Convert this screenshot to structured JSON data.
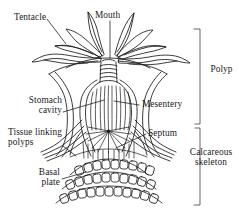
{
  "figure": {
    "type": "biological-line-diagram",
    "ink_color": "#1a1a1a",
    "background_color": "#ffffff"
  },
  "labels": {
    "tentacle": "Tentacle",
    "mouth": "Mouth",
    "stomach_cavity_line1": "Stomach",
    "stomach_cavity_line2": "cavity",
    "tissue_linking_line1": "Tissue linking",
    "tissue_linking_line2": "polyps",
    "basal_plate_line1": "Basal",
    "basal_plate_line2": "plate",
    "mesentery": "Mesentery",
    "septum": "Septum",
    "polyp": "Polyp",
    "calcareous_line1": "Calcareous",
    "calcareous_line2": "skeleton"
  },
  "brackets": [
    {
      "name": "polyp-bracket",
      "label": "Polyp",
      "top_y": 28,
      "bottom_y": 124,
      "x": 200
    },
    {
      "name": "calcareous-skeleton-bracket",
      "label": "Calcareous skeleton",
      "top_y": 128,
      "bottom_y": 205,
      "x": 200
    }
  ],
  "structures": {
    "tentacle_count": 8,
    "pharynx_rings": 4,
    "mesentery_stripes": 11,
    "skeleton_rows": 3,
    "skeleton_cells_per_row": [
      11,
      11,
      11
    ],
    "linking_tissue_strands": 4
  }
}
